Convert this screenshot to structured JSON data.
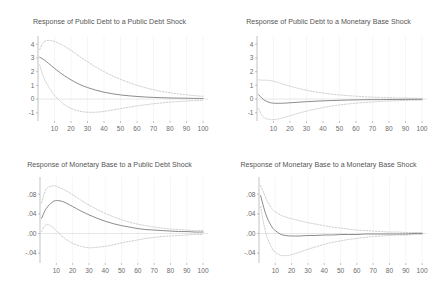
{
  "figure": {
    "layout": "2x2 grid of impulse response panels",
    "background_color": "#ffffff",
    "line_color": "#777777",
    "band_color": "#b4b4b4",
    "text_color": "#555555"
  },
  "chart_data": [
    {
      "type": "line",
      "panel": "top-left",
      "title": "Response of Public Debt to a Public Debt Shock",
      "xlabel": "",
      "ylabel": "",
      "grid": true,
      "legend": "none",
      "xlim": [
        0,
        103
      ],
      "ylim": [
        -1.6,
        4.6
      ],
      "xticks": [
        10,
        20,
        30,
        40,
        50,
        60,
        70,
        80,
        90,
        100
      ],
      "yticks": [
        -1,
        0,
        1,
        2,
        3,
        4
      ],
      "ytick_labels": [
        "-1",
        "0",
        "1",
        "2",
        "3",
        "4"
      ],
      "x": [
        1,
        3,
        5,
        8,
        10,
        13,
        16,
        20,
        25,
        30,
        35,
        40,
        45,
        50,
        55,
        60,
        65,
        70,
        75,
        80,
        85,
        90,
        95,
        100
      ],
      "series": [
        {
          "name": "response",
          "style": "solid",
          "values": [
            3.05,
            2.92,
            2.74,
            2.44,
            2.24,
            1.96,
            1.7,
            1.4,
            1.08,
            0.84,
            0.65,
            0.5,
            0.39,
            0.3,
            0.24,
            0.19,
            0.15,
            0.12,
            0.1,
            0.08,
            0.07,
            0.06,
            0.05,
            0.04
          ]
        },
        {
          "name": "upper-band",
          "style": "dashed",
          "values": [
            3.6,
            4.08,
            4.26,
            4.27,
            4.2,
            4.05,
            3.85,
            3.55,
            3.12,
            2.72,
            2.34,
            2.0,
            1.7,
            1.44,
            1.21,
            1.0,
            0.83,
            0.68,
            0.56,
            0.46,
            0.38,
            0.31,
            0.25,
            0.2
          ]
        },
        {
          "name": "lower-band",
          "style": "dashed",
          "values": [
            2.5,
            1.72,
            1.2,
            0.6,
            0.28,
            -0.1,
            -0.4,
            -0.68,
            -0.88,
            -0.96,
            -0.96,
            -0.9,
            -0.8,
            -0.7,
            -0.6,
            -0.5,
            -0.42,
            -0.34,
            -0.28,
            -0.22,
            -0.18,
            -0.14,
            -0.11,
            -0.09
          ]
        }
      ]
    },
    {
      "type": "line",
      "panel": "top-right",
      "title": "Response of Public Debt to a Monetary Base Shock",
      "xlabel": "",
      "ylabel": "",
      "grid": true,
      "legend": "none",
      "xlim": [
        0,
        103
      ],
      "ylim": [
        -1.6,
        4.6
      ],
      "xticks": [
        10,
        20,
        30,
        40,
        50,
        60,
        70,
        80,
        90,
        100
      ],
      "yticks": [
        -1,
        0,
        1,
        2,
        3,
        4
      ],
      "ytick_labels": [
        "-1",
        "0",
        "1",
        "2",
        "3",
        "4"
      ],
      "x": [
        1,
        3,
        5,
        8,
        10,
        13,
        16,
        20,
        25,
        30,
        35,
        40,
        45,
        50,
        55,
        60,
        65,
        70,
        75,
        80,
        85,
        90,
        95,
        100
      ],
      "series": [
        {
          "name": "response",
          "style": "solid",
          "values": [
            0.32,
            0.06,
            -0.12,
            -0.26,
            -0.3,
            -0.31,
            -0.3,
            -0.27,
            -0.23,
            -0.19,
            -0.16,
            -0.13,
            -0.11,
            -0.09,
            -0.07,
            -0.06,
            -0.05,
            -0.04,
            -0.04,
            -0.03,
            -0.03,
            -0.02,
            -0.02,
            -0.02
          ]
        },
        {
          "name": "upper-band",
          "style": "dashed",
          "values": [
            1.4,
            1.38,
            1.38,
            1.35,
            1.3,
            1.2,
            1.08,
            0.94,
            0.78,
            0.64,
            0.53,
            0.44,
            0.36,
            0.3,
            0.25,
            0.21,
            0.17,
            0.14,
            0.12,
            0.1,
            0.08,
            0.07,
            0.06,
            0.05
          ]
        },
        {
          "name": "lower-band",
          "style": "dashed",
          "values": [
            -0.7,
            -1.2,
            -1.4,
            -1.5,
            -1.5,
            -1.45,
            -1.36,
            -1.22,
            -1.04,
            -0.88,
            -0.74,
            -0.62,
            -0.52,
            -0.43,
            -0.36,
            -0.3,
            -0.25,
            -0.21,
            -0.17,
            -0.14,
            -0.12,
            -0.1,
            -0.08,
            -0.07
          ]
        }
      ]
    },
    {
      "type": "line",
      "panel": "bottom-left",
      "title": "Response of Monetary Base to a Public Debt Shock",
      "xlabel": "",
      "ylabel": "",
      "grid": true,
      "legend": "none",
      "xlim": [
        0,
        103
      ],
      "ylim": [
        -0.06,
        0.115
      ],
      "xticks": [
        10,
        20,
        30,
        40,
        50,
        60,
        70,
        80,
        90,
        100
      ],
      "yticks": [
        -0.04,
        0.0,
        0.04,
        0.08
      ],
      "ytick_labels": [
        "-.04",
        ".00",
        ".04",
        ".08"
      ],
      "x": [
        1,
        3,
        5,
        8,
        10,
        13,
        16,
        20,
        25,
        30,
        35,
        40,
        45,
        50,
        55,
        60,
        65,
        70,
        75,
        80,
        85,
        90,
        95,
        100
      ],
      "series": [
        {
          "name": "response",
          "style": "solid",
          "values": [
            0.031,
            0.046,
            0.056,
            0.065,
            0.067,
            0.066,
            0.062,
            0.055,
            0.046,
            0.038,
            0.031,
            0.025,
            0.02,
            0.016,
            0.013,
            0.01,
            0.008,
            0.007,
            0.006,
            0.005,
            0.004,
            0.004,
            0.003,
            0.003
          ]
        },
        {
          "name": "upper-band",
          "style": "dashed",
          "values": [
            0.062,
            0.085,
            0.094,
            0.097,
            0.096,
            0.092,
            0.087,
            0.079,
            0.068,
            0.058,
            0.049,
            0.041,
            0.034,
            0.028,
            0.023,
            0.019,
            0.016,
            0.013,
            0.011,
            0.009,
            0.008,
            0.007,
            0.006,
            0.006
          ]
        },
        {
          "name": "lower-band",
          "style": "dashed",
          "values": [
            0.004,
            0.016,
            0.018,
            0.012,
            0.006,
            -0.004,
            -0.012,
            -0.02,
            -0.026,
            -0.029,
            -0.028,
            -0.026,
            -0.023,
            -0.019,
            -0.016,
            -0.013,
            -0.01,
            -0.008,
            -0.006,
            -0.005,
            -0.004,
            -0.003,
            -0.002,
            -0.002
          ]
        }
      ]
    },
    {
      "type": "line",
      "panel": "bottom-right",
      "title": "Response of Monetary Base to a Monetary Base Shock",
      "xlabel": "",
      "ylabel": "",
      "grid": true,
      "legend": "none",
      "xlim": [
        0,
        103
      ],
      "ylim": [
        -0.06,
        0.115
      ],
      "xticks": [
        10,
        20,
        30,
        40,
        50,
        60,
        70,
        80,
        90,
        100
      ],
      "yticks": [
        -0.04,
        0.0,
        0.04,
        0.08
      ],
      "ytick_labels": [
        "-.04",
        ".00",
        ".04",
        ".08"
      ],
      "x": [
        1,
        3,
        5,
        8,
        10,
        13,
        16,
        20,
        25,
        30,
        35,
        40,
        45,
        50,
        55,
        60,
        65,
        70,
        75,
        80,
        85,
        90,
        95,
        100
      ],
      "series": [
        {
          "name": "response",
          "style": "solid",
          "values": [
            0.077,
            0.052,
            0.032,
            0.013,
            0.006,
            -0.001,
            -0.004,
            -0.005,
            -0.005,
            -0.004,
            -0.004,
            -0.003,
            -0.003,
            -0.002,
            -0.002,
            -0.002,
            -0.001,
            -0.001,
            -0.001,
            -0.001,
            -0.001,
            -0.001,
            0.0,
            0.0
          ]
        },
        {
          "name": "upper-band",
          "style": "dashed",
          "values": [
            0.098,
            0.082,
            0.066,
            0.05,
            0.044,
            0.038,
            0.034,
            0.03,
            0.026,
            0.022,
            0.019,
            0.016,
            0.013,
            0.011,
            0.009,
            0.007,
            0.006,
            0.005,
            0.004,
            0.003,
            0.003,
            0.002,
            0.002,
            0.002
          ]
        },
        {
          "name": "lower-band",
          "style": "dashed",
          "values": [
            0.055,
            0.018,
            -0.008,
            -0.03,
            -0.038,
            -0.044,
            -0.045,
            -0.043,
            -0.038,
            -0.032,
            -0.027,
            -0.022,
            -0.018,
            -0.015,
            -0.012,
            -0.01,
            -0.008,
            -0.006,
            -0.005,
            -0.004,
            -0.003,
            -0.003,
            -0.002,
            -0.002
          ]
        }
      ]
    }
  ]
}
